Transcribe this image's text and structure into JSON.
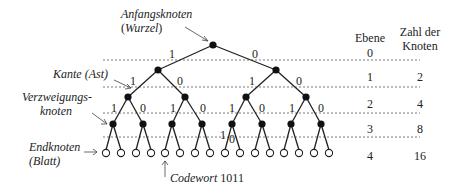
{
  "annotations": {
    "root_line1": "Anfangsknoten",
    "root_line2_open": "(",
    "root_line2_word": "Wurzel",
    "root_line2_close": ")",
    "edge": "Kante (Ast)",
    "branch_line1": "Verzweigungs-",
    "branch_line2": "knoten",
    "leaf_line1": "Endknoten",
    "leaf_line2": "(Blatt)",
    "codeword_label": "Codewort",
    "codeword_value": "1011"
  },
  "table": {
    "header_level": "Ebene",
    "header_count_line1": "Zahl der",
    "header_count_line2": "Knoten",
    "rows": [
      {
        "level": "0",
        "count": ""
      },
      {
        "level": "1",
        "count": "2"
      },
      {
        "level": "2",
        "count": "4"
      },
      {
        "level": "3",
        "count": "8"
      },
      {
        "level": "4",
        "count": "16"
      }
    ]
  },
  "tree": {
    "edge_labels": {
      "l0": [
        "1",
        "0"
      ],
      "l1": [
        "1",
        "0",
        "1",
        "0"
      ],
      "l2": [
        "1",
        "0",
        "1",
        "0",
        "1",
        "0",
        "1",
        "0"
      ],
      "l3_path": [
        "1",
        "0"
      ]
    },
    "depth": 4,
    "leaf_count": 16
  }
}
